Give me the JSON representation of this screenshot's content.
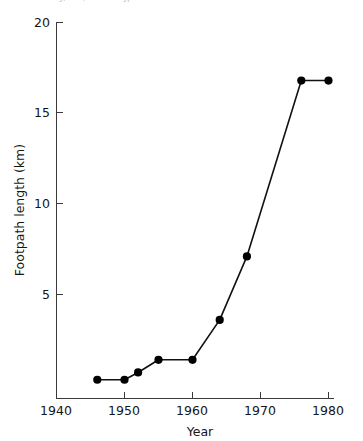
{
  "figure": {
    "clipped_top_text": "GKJ, TH, IKM H. Jpn   kmkl t n   ll n H",
    "background_color": "#ffffff",
    "line_color": "#111111",
    "marker_color": "#000000",
    "axis_color": "#3a3a3a"
  },
  "chart_data": {
    "type": "line",
    "title": "",
    "xlabel": "Year",
    "ylabel": "Footpath length (km)",
    "xlim": [
      1940,
      1982
    ],
    "ylim": [
      0,
      20
    ],
    "xticks": [
      1940,
      1950,
      1960,
      1970,
      1980
    ],
    "xtick_labels": [
      "1940",
      "1950",
      "1960",
      "1970",
      "1980"
    ],
    "yticks": [
      5,
      10,
      15,
      20
    ],
    "ytick_labels": [
      "5",
      "10",
      "15",
      "20"
    ],
    "grid": false,
    "legend": false,
    "legend_position": "none",
    "marker": "filled-circle",
    "series": [
      {
        "name": "Footpath length",
        "x": [
          1946,
          1950,
          1952,
          1955,
          1960,
          1964,
          1968,
          1976,
          1980
        ],
        "values": [
          0.3,
          0.3,
          0.7,
          1.4,
          1.4,
          3.6,
          7.1,
          16.8,
          16.8
        ]
      }
    ]
  }
}
